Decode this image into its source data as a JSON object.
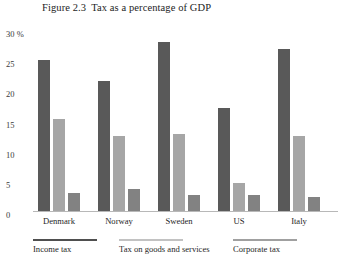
{
  "figure": {
    "number": "Figure 2.3",
    "title": "Tax as a percentage of GDP",
    "source_note": ""
  },
  "axis": {
    "y_ticks": [
      "30 %",
      "25",
      "20",
      "15",
      "10",
      "5",
      "0"
    ]
  },
  "legend": {
    "items": [
      {
        "label": "Income tax",
        "color": "#4f4f4f"
      },
      {
        "label": "Tax on goods and services",
        "color": "#c2c2c2"
      },
      {
        "label": "Corporate tax",
        "color": "#a0a0a0"
      }
    ]
  },
  "chart_data": {
    "type": "bar",
    "xlabel": "",
    "ylabel": "30 %",
    "ylim": [
      0,
      30
    ],
    "yticks": [
      0,
      5,
      10,
      15,
      20,
      25,
      30
    ],
    "grid": false,
    "legend_position": "bottom",
    "categories": [
      "Denmark",
      "Norway",
      "Sweden",
      "US",
      "Italy"
    ],
    "series": [
      {
        "name": "Income tax",
        "color": "#595959",
        "values": [
          25.0,
          21.6,
          28.0,
          17.0,
          26.8
        ]
      },
      {
        "name": "Tax on goods and services",
        "color": "#a6a6a6",
        "values": [
          15.3,
          12.4,
          12.8,
          4.7,
          12.5
        ]
      },
      {
        "name": "Corporate tax",
        "color": "#828282",
        "values": [
          3.0,
          3.7,
          2.7,
          2.6,
          2.4
        ]
      }
    ]
  }
}
